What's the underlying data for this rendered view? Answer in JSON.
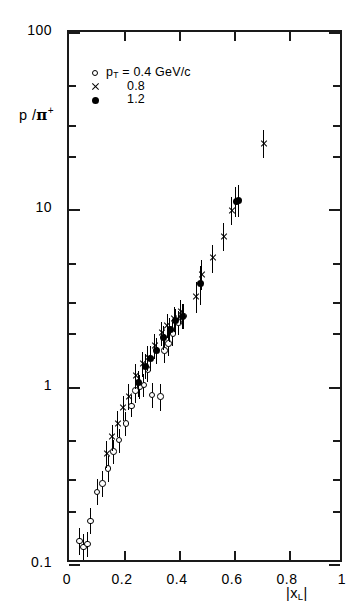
{
  "figure": {
    "y_axis_title_main": "p /",
    "y_axis_title_pi": "π",
    "y_axis_title_sup": "+",
    "x_axis_title_main": "|x",
    "x_axis_title_sub": "L",
    "x_axis_title_tail": "|"
  },
  "legend": {
    "rows": [
      {
        "marker": "open-circle",
        "text": "p",
        "sub": "T",
        "tail": " = 0.4 GeV/c"
      },
      {
        "marker": "cross",
        "text": "",
        "sub": "",
        "tail": "0.8"
      },
      {
        "marker": "filled-circle",
        "text": "",
        "sub": "",
        "tail": "1.2"
      }
    ],
    "labels": [
      "p_T = 0.4 GeV/c",
      "0.8",
      "1.2"
    ]
  },
  "axes": {
    "y_ticks_major": [
      "100",
      "10",
      "1",
      "0.1"
    ],
    "x_ticks": [
      "0",
      "0.2",
      "0.4",
      "0.6",
      "0.8",
      "1"
    ]
  },
  "chart_data": {
    "type": "scatter",
    "title": "",
    "xlabel": "|x_L|",
    "ylabel": "p / π+",
    "xlim": [
      0,
      1
    ],
    "ylim": [
      0.1,
      100
    ],
    "yscale": "log",
    "xscale": "linear",
    "grid": false,
    "legend_position": "upper-left-inside",
    "series": [
      {
        "name": "p_T = 0.4 GeV/c",
        "marker": "open-circle",
        "points": [
          {
            "x": 0.035,
            "y": 0.135,
            "yerr_lo": 0.022,
            "yerr_hi": 0.025
          },
          {
            "x": 0.05,
            "y": 0.125,
            "yerr_lo": 0.02,
            "yerr_hi": 0.022
          },
          {
            "x": 0.065,
            "y": 0.13,
            "yerr_lo": 0.02,
            "yerr_hi": 0.022
          },
          {
            "x": 0.075,
            "y": 0.175,
            "yerr_lo": 0.028,
            "yerr_hi": 0.032
          },
          {
            "x": 0.1,
            "y": 0.255,
            "yerr_lo": 0.04,
            "yerr_hi": 0.045
          },
          {
            "x": 0.12,
            "y": 0.285,
            "yerr_lo": 0.045,
            "yerr_hi": 0.05
          },
          {
            "x": 0.14,
            "y": 0.345,
            "yerr_lo": 0.055,
            "yerr_hi": 0.06
          },
          {
            "x": 0.16,
            "y": 0.43,
            "yerr_lo": 0.065,
            "yerr_hi": 0.07
          },
          {
            "x": 0.18,
            "y": 0.5,
            "yerr_lo": 0.075,
            "yerr_hi": 0.08
          },
          {
            "x": 0.205,
            "y": 0.62,
            "yerr_lo": 0.09,
            "yerr_hi": 0.1
          },
          {
            "x": 0.225,
            "y": 0.78,
            "yerr_lo": 0.11,
            "yerr_hi": 0.12
          },
          {
            "x": 0.24,
            "y": 0.95,
            "yerr_lo": 0.14,
            "yerr_hi": 0.15
          },
          {
            "x": 0.255,
            "y": 1.0,
            "yerr_lo": 0.15,
            "yerr_hi": 0.16
          },
          {
            "x": 0.27,
            "y": 1.02,
            "yerr_lo": 0.15,
            "yerr_hi": 0.16
          },
          {
            "x": 0.285,
            "y": 1.25,
            "yerr_lo": 0.19,
            "yerr_hi": 0.2
          },
          {
            "x": 0.3,
            "y": 0.9,
            "yerr_lo": 0.14,
            "yerr_hi": 0.15
          },
          {
            "x": 0.33,
            "y": 0.88,
            "yerr_lo": 0.15,
            "yerr_hi": 0.16
          },
          {
            "x": 0.345,
            "y": 1.6,
            "yerr_lo": 0.24,
            "yerr_hi": 0.26
          },
          {
            "x": 0.36,
            "y": 1.75,
            "yerr_lo": 0.26,
            "yerr_hi": 0.28
          },
          {
            "x": 0.375,
            "y": 2.0,
            "yerr_lo": 0.3,
            "yerr_hi": 0.32
          },
          {
            "x": 0.395,
            "y": 2.3,
            "yerr_lo": 0.35,
            "yerr_hi": 0.38
          },
          {
            "x": 0.415,
            "y": 2.5,
            "yerr_lo": 0.38,
            "yerr_hi": 0.42
          }
        ]
      },
      {
        "name": "0.8",
        "marker": "cross",
        "points": [
          {
            "x": 0.135,
            "y": 0.42,
            "yerr_lo": 0.07,
            "yerr_hi": 0.075
          },
          {
            "x": 0.155,
            "y": 0.52,
            "yerr_lo": 0.085,
            "yerr_hi": 0.09
          },
          {
            "x": 0.175,
            "y": 0.62,
            "yerr_lo": 0.1,
            "yerr_hi": 0.11
          },
          {
            "x": 0.195,
            "y": 0.76,
            "yerr_lo": 0.12,
            "yerr_hi": 0.13
          },
          {
            "x": 0.215,
            "y": 0.88,
            "yerr_lo": 0.14,
            "yerr_hi": 0.15
          },
          {
            "x": 0.24,
            "y": 1.15,
            "yerr_lo": 0.18,
            "yerr_hi": 0.19
          },
          {
            "x": 0.265,
            "y": 1.35,
            "yerr_lo": 0.21,
            "yerr_hi": 0.22
          },
          {
            "x": 0.285,
            "y": 1.45,
            "yerr_lo": 0.22,
            "yerr_hi": 0.24
          },
          {
            "x": 0.31,
            "y": 1.7,
            "yerr_lo": 0.26,
            "yerr_hi": 0.28
          },
          {
            "x": 0.335,
            "y": 2.0,
            "yerr_lo": 0.3,
            "yerr_hi": 0.33
          },
          {
            "x": 0.355,
            "y": 2.2,
            "yerr_lo": 0.33,
            "yerr_hi": 0.36
          },
          {
            "x": 0.38,
            "y": 2.4,
            "yerr_lo": 0.36,
            "yerr_hi": 0.4
          },
          {
            "x": 0.405,
            "y": 2.65,
            "yerr_lo": 0.4,
            "yerr_hi": 0.44
          },
          {
            "x": 0.46,
            "y": 3.2,
            "yerr_lo": 0.6,
            "yerr_hi": 0.7
          },
          {
            "x": 0.48,
            "y": 4.3,
            "yerr_lo": 0.8,
            "yerr_hi": 0.9
          },
          {
            "x": 0.52,
            "y": 5.3,
            "yerr_lo": 0.9,
            "yerr_hi": 1.0
          },
          {
            "x": 0.56,
            "y": 7.0,
            "yerr_lo": 1.2,
            "yerr_hi": 1.4
          },
          {
            "x": 0.59,
            "y": 9.8,
            "yerr_lo": 1.6,
            "yerr_hi": 1.9
          },
          {
            "x": 0.705,
            "y": 23.5,
            "yerr_lo": 4.0,
            "yerr_hi": 4.5
          }
        ]
      },
      {
        "name": "1.2",
        "marker": "filled-circle",
        "points": [
          {
            "x": 0.25,
            "y": 1.05,
            "yerr_lo": 0.17,
            "yerr_hi": 0.18
          },
          {
            "x": 0.275,
            "y": 1.3,
            "yerr_lo": 0.2,
            "yerr_hi": 0.22
          },
          {
            "x": 0.295,
            "y": 1.45,
            "yerr_lo": 0.23,
            "yerr_hi": 0.25
          },
          {
            "x": 0.315,
            "y": 1.6,
            "yerr_lo": 0.25,
            "yerr_hi": 0.27
          },
          {
            "x": 0.34,
            "y": 1.9,
            "yerr_lo": 0.29,
            "yerr_hi": 0.31
          },
          {
            "x": 0.365,
            "y": 2.1,
            "yerr_lo": 0.32,
            "yerr_hi": 0.34
          },
          {
            "x": 0.385,
            "y": 2.35,
            "yerr_lo": 0.36,
            "yerr_hi": 0.39
          },
          {
            "x": 0.41,
            "y": 2.5,
            "yerr_lo": 0.38,
            "yerr_hi": 0.42
          },
          {
            "x": 0.475,
            "y": 3.8,
            "yerr_lo": 0.9,
            "yerr_hi": 1.0
          },
          {
            "x": 0.605,
            "y": 11.0,
            "yerr_lo": 2.0,
            "yerr_hi": 2.4
          },
          {
            "x": 0.615,
            "y": 11.2,
            "yerr_lo": 2.1,
            "yerr_hi": 2.5
          }
        ]
      }
    ]
  }
}
